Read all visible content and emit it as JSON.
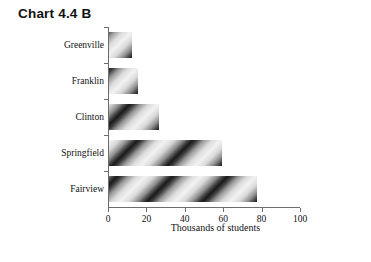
{
  "chart_data": {
    "type": "bar",
    "orientation": "horizontal",
    "title": "Chart 4.4 B",
    "xlabel": "Thousands of students",
    "ylabel": "",
    "categories": [
      "Greenville",
      "Franklin",
      "Clinton",
      "Springfield",
      "Fairview"
    ],
    "values": [
      12,
      15,
      26,
      59,
      77
    ],
    "xlim": [
      0,
      100
    ],
    "xticks": [
      0,
      20,
      40,
      60,
      80,
      100
    ],
    "xtick_labels": [
      "0",
      "20",
      "40",
      "60",
      "80",
      "100"
    ],
    "grid": false,
    "legend": null,
    "series": [
      {
        "name": "Thousands of students",
        "values": [
          12,
          15,
          26,
          59,
          77
        ]
      }
    ]
  },
  "title": {
    "text": "Chart 4.4 B"
  },
  "axes": {
    "x_axis_title": "Thousands of students",
    "x_tick_labels": [
      "0",
      "20",
      "40",
      "60",
      "80",
      "100"
    ],
    "y_tick_labels": [
      "Greenville",
      "Franklin",
      "Clinton",
      "Springfield",
      "Fairview"
    ]
  },
  "colors": {
    "axis": "#6d6d6d",
    "text": "#111111",
    "background": "#ffffff",
    "bar_dark": "#1a1a1a",
    "bar_light": "#f2f2f2"
  }
}
